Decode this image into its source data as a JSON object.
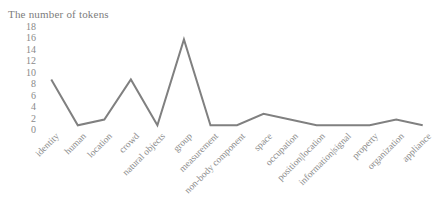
{
  "chart_data": {
    "type": "line",
    "title": "The number of tokens",
    "xlabel": "",
    "ylabel": "",
    "ylim": [
      0,
      18
    ],
    "yticks": [
      0,
      2,
      4,
      6,
      8,
      10,
      12,
      14,
      16,
      18
    ],
    "grid": false,
    "legend": "none",
    "line_color": "#808080",
    "categories": [
      "identity",
      "human",
      "location",
      "crowd",
      "natural objects",
      "group",
      "measurement",
      "non-body component",
      "space",
      "occupation",
      "position|location",
      "information|signal",
      "property",
      "organization",
      "appliance"
    ],
    "values": [
      9,
      1,
      2,
      9,
      1,
      16,
      1,
      1,
      3,
      2,
      1,
      1,
      1,
      2,
      1
    ]
  }
}
